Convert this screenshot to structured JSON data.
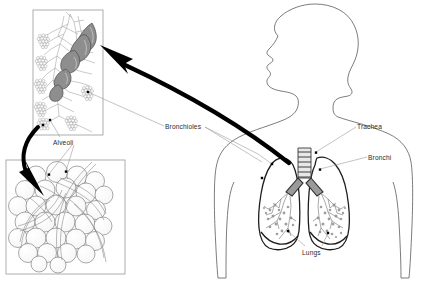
{
  "figure": {
    "background_color": "#ffffff",
    "line_color": "#4a4a4a",
    "arrow_color": "#000000",
    "text_color": "#2b2b2b",
    "shading_color": "#8c8c8c"
  },
  "labels": {
    "bronchioles": "Bronchioles",
    "trachea": "Trachea",
    "bronchi": "Bronchi",
    "lungs": "Lungs",
    "alveoli": "Alveoli"
  },
  "panels": {
    "bronchiole_inset": {
      "name": "Bronchiole and alveolar sac detail",
      "x": 33,
      "y": 10,
      "width": 70,
      "height": 125
    },
    "alveoli_inset": {
      "name": "Alveoli cluster with capillaries detail",
      "x": 6,
      "y": 160,
      "width": 119,
      "height": 114
    }
  },
  "body": {
    "name": "Human head and torso silhouette, facing left"
  },
  "callouts": [
    {
      "label": "Bronchioles",
      "target": "bronchioles-marker-left-lung"
    },
    {
      "label": "Bronchioles",
      "target": "bronchioles-marker-inset"
    },
    {
      "label": "Trachea",
      "target": "trachea-marker"
    },
    {
      "label": "Bronchi",
      "target": "bronchi-marker"
    },
    {
      "label": "Lungs",
      "target": "lungs-marker-left"
    },
    {
      "label": "Lungs",
      "target": "lungs-marker-right"
    },
    {
      "label": "Alveoli",
      "target": "alveoli-marker-inset-top"
    },
    {
      "label": "Alveoli",
      "target": "alveoli-marker-inset-bottom"
    }
  ],
  "zoom_arrows": [
    {
      "name": "lung-to-bronchiole-inset-arrow",
      "from": "right lung hilum",
      "to": "bronchiole inset"
    },
    {
      "name": "bronchiole-to-alveoli-inset-arrow",
      "from": "bronchiole inset alveolar sac",
      "to": "alveoli inset"
    }
  ]
}
